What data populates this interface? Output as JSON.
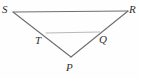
{
  "figure": {
    "kind": "geometry-diagram",
    "background_color": "#fefefe",
    "stroke_color_outer": "#6e6e6e",
    "stroke_color_inner": "#b9b9b9",
    "label_color": "#2f2f2f",
    "width": 141,
    "height": 78
  },
  "points": {
    "S": {
      "label": "S",
      "x": 13,
      "y": 12
    },
    "R": {
      "label": "R",
      "x": 128,
      "y": 11
    },
    "P": {
      "label": "P",
      "x": 71,
      "y": 57
    },
    "T": {
      "label": "T",
      "x": 46,
      "y": 33
    },
    "Q": {
      "label": "Q",
      "x": 100,
      "y": 33
    }
  },
  "segments": [
    {
      "name": "SR",
      "from": "S",
      "to": "R"
    },
    {
      "name": "SP",
      "from": "S",
      "to": "P"
    },
    {
      "name": "RP",
      "from": "R",
      "to": "P"
    },
    {
      "name": "TQ",
      "from": "T",
      "to": "Q"
    }
  ]
}
